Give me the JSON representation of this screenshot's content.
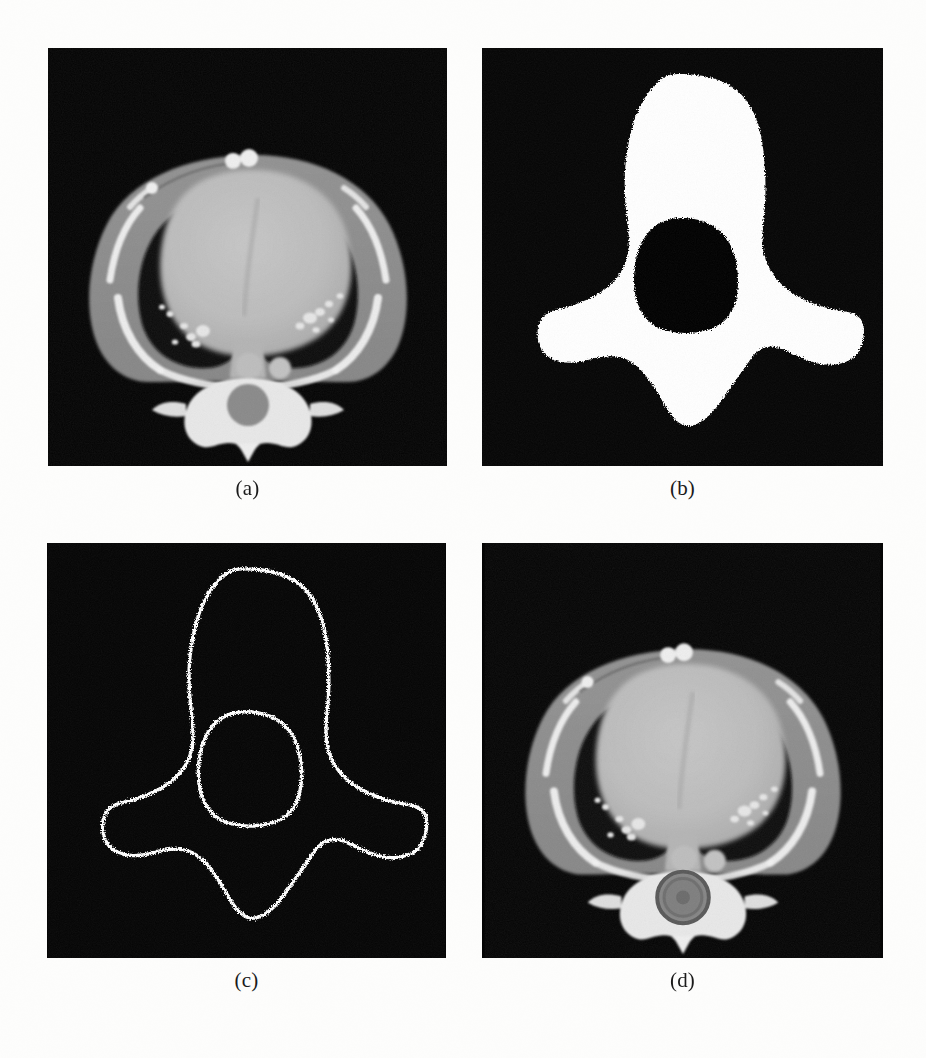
{
  "figure": {
    "kind": "medical-imaging-figure",
    "modality": "CT",
    "view": "axial chest slice",
    "layout": "2x2 grid",
    "background_color": "#fdfdfc",
    "panel_background_color": "#040404",
    "mask_color": "#ffffff",
    "contour_color": "#ffffff",
    "overlay_ring_color": "#6b6b6b"
  },
  "panels": [
    {
      "id": "a",
      "caption": "(a)",
      "content": "original axial chest CT slice",
      "position": "top-left"
    },
    {
      "id": "b",
      "caption": "(b)",
      "content": "binary segmentation mask",
      "position": "top-right"
    },
    {
      "id": "c",
      "caption": "(c)",
      "content": "extracted boundary contour",
      "position": "bottom-left"
    },
    {
      "id": "d",
      "caption": "(d)",
      "content": "CT slice with segmentation overlay on spinal canal",
      "position": "bottom-right"
    }
  ]
}
